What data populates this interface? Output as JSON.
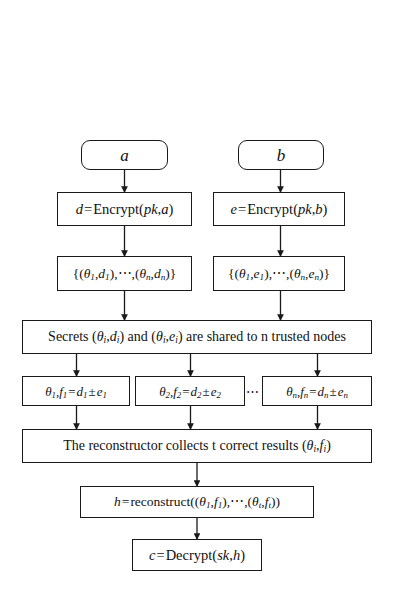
{
  "figure": {
    "type": "flowchart",
    "title": "",
    "orientation": "top-to-bottom",
    "background_color": "#ffffff",
    "line_color": "#1a1a1a"
  },
  "nodes": {
    "input_a": {
      "label": "a",
      "shape": "rounded-rectangle"
    },
    "input_b": {
      "label": "b",
      "shape": "rounded-rectangle"
    },
    "encrypt_a": {
      "label": "d = Encrypt(pk,a)",
      "shape": "rectangle",
      "parts": {
        "lhs": "d",
        "eq": "=",
        "fn": "Encrypt",
        "args": "pk,a"
      }
    },
    "encrypt_b": {
      "label": "e = Encrypt(pk,b)",
      "shape": "rectangle",
      "parts": {
        "lhs": "e",
        "eq": "=",
        "fn": "Encrypt",
        "args": "pk,b"
      }
    },
    "shares_d": {
      "label": "{(θ1,d1),⋯,(θn,dn)}",
      "shape": "rectangle",
      "parts": {
        "first_theta": "θ",
        "first_theta_sub": "1",
        "first_val": "d",
        "first_val_sub": "1",
        "last_theta": "θ",
        "last_theta_sub": "n",
        "last_val": "d",
        "last_val_sub": "n"
      }
    },
    "shares_e": {
      "label": "{(θ1,e1),⋯,(θn,en)}",
      "shape": "rectangle",
      "parts": {
        "first_theta": "θ",
        "first_theta_sub": "1",
        "first_val": "e",
        "first_val_sub": "1",
        "last_theta": "θ",
        "last_theta_sub": "n",
        "last_val": "e",
        "last_val_sub": "n"
      }
    },
    "secrets_shared": {
      "label": "Secrets (θi,di) and (θi,ei) are shared to n trusted nodes",
      "shape": "rectangle",
      "parts": {
        "lead": "Secrets",
        "mid": "and",
        "tail": "are shared to n trusted nodes"
      }
    },
    "node_1": {
      "label": "θ1, f1 = d1 ± e1",
      "shape": "rectangle",
      "index": "1"
    },
    "node_2": {
      "label": "θ2, f2 = d2 ± e2",
      "shape": "rectangle",
      "index": "2"
    },
    "node_n": {
      "label": "θn, fn = dn ± en",
      "shape": "rectangle",
      "index": "n"
    },
    "ellipsis_between_nodes": {
      "label": "⋯"
    },
    "reconstructor": {
      "label": "The reconstructor collects t correct results (θi,fi)",
      "shape": "rectangle",
      "parts": {
        "text": "The reconstructor collects t correct results"
      }
    },
    "reconstruct": {
      "label": "h = reconstruct((θ1,f1),⋯,(θt,ft))",
      "shape": "rectangle",
      "parts": {
        "lhs": "h",
        "eq": "=",
        "fn": "reconstruct"
      }
    },
    "decrypt": {
      "label": "c = Decrypt(sk,h)",
      "shape": "rectangle",
      "parts": {
        "lhs": "c",
        "eq": "=",
        "fn": "Decrypt",
        "args": "sk,h"
      }
    }
  },
  "edges": [
    {
      "from": "input_a",
      "to": "encrypt_a"
    },
    {
      "from": "input_b",
      "to": "encrypt_b"
    },
    {
      "from": "encrypt_a",
      "to": "shares_d"
    },
    {
      "from": "encrypt_b",
      "to": "shares_e"
    },
    {
      "from": "shares_d",
      "to": "secrets_shared"
    },
    {
      "from": "shares_e",
      "to": "secrets_shared"
    },
    {
      "from": "secrets_shared",
      "to": "node_1"
    },
    {
      "from": "secrets_shared",
      "to": "node_2"
    },
    {
      "from": "secrets_shared",
      "to": "node_n"
    },
    {
      "from": "node_1",
      "to": "reconstructor"
    },
    {
      "from": "node_2",
      "to": "reconstructor"
    },
    {
      "from": "node_n",
      "to": "reconstructor"
    },
    {
      "from": "reconstructor",
      "to": "reconstruct"
    },
    {
      "from": "reconstruct",
      "to": "decrypt"
    }
  ],
  "symbols": {
    "theta": "θ",
    "plus_minus": "±",
    "cdots": "⋯",
    "comma": ",",
    "lbrace": "{",
    "rbrace": "}",
    "lparen": "(",
    "rparen": ")",
    "equals": "="
  }
}
